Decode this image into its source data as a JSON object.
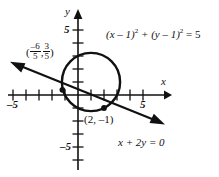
{
  "figure": {
    "type": "analytic-geometry-plot",
    "axes": {
      "x_name": "x",
      "y_name": "y",
      "x_tick_labels": [
        {
          "value": -5,
          "text": "–5"
        },
        {
          "value": 5,
          "text": "5"
        }
      ],
      "y_tick_labels": [
        {
          "value": 5,
          "text": "5"
        },
        {
          "value": -5,
          "text": "–5"
        }
      ],
      "x_range": [
        -6,
        7
      ],
      "y_range": [
        -6,
        6
      ],
      "tick_step": 1
    },
    "curves": {
      "circle": {
        "label_parts": {
          "lead": "(x – 1)",
          "exp1": "2",
          "mid": " + (y – 1)",
          "exp2": "2",
          "tail": " = 5"
        },
        "center": [
          1,
          1
        ],
        "radius_squared": 5
      },
      "line": {
        "label": "x + 2y = 0",
        "slope": -0.5,
        "intercept": 0
      }
    },
    "points": [
      {
        "name": "upper-left-intersection",
        "x_num": "–6",
        "x_den": "5",
        "y_num": "3",
        "y_den": "5",
        "open": "(",
        "comma": ", ",
        "close": ")"
      },
      {
        "name": "lower-right-intersection",
        "label": "(2, –1)"
      }
    ]
  }
}
